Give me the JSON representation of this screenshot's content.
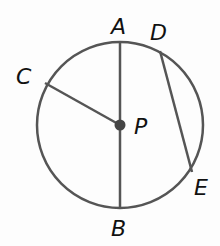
{
  "diagram": {
    "type": "circle-geometry",
    "circle": {
      "center_label": "P",
      "cx": 120,
      "cy": 125,
      "r": 83,
      "stroke": "#555555"
    },
    "points": [
      {
        "label": "A",
        "x": 120,
        "y": 42,
        "label_x": 111,
        "label_y": 34
      },
      {
        "label": "B",
        "x": 120,
        "y": 208,
        "label_x": 111,
        "label_y": 236
      },
      {
        "label": "C",
        "x": 45,
        "y": 83,
        "label_x": 16,
        "label_y": 84
      },
      {
        "label": "D",
        "x": 160,
        "y": 51,
        "label_x": 150,
        "label_y": 40
      },
      {
        "label": "E",
        "x": 192,
        "y": 172,
        "label_x": 194,
        "label_y": 195
      },
      {
        "label": "P",
        "x": 120,
        "y": 125,
        "label_x": 134,
        "label_y": 134
      }
    ],
    "segments": [
      {
        "name": "diameter-AB",
        "from": "A",
        "to": "B"
      },
      {
        "name": "radius-PC",
        "from": "P",
        "to": "C"
      },
      {
        "name": "chord-DE",
        "from": "D",
        "to": "E"
      }
    ]
  }
}
